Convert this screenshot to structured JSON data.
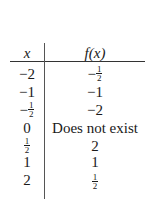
{
  "table": {
    "headers": {
      "x": "x",
      "f": "f(x)"
    },
    "rows": [
      {
        "x": {
          "sign": "−",
          "value": "2"
        },
        "f": {
          "sign": "−",
          "num": "1",
          "den": "2"
        }
      },
      {
        "x": {
          "sign": "−",
          "value": "1"
        },
        "f": {
          "sign": "−",
          "value": "1"
        }
      },
      {
        "x": {
          "sign": "−",
          "num": "1",
          "den": "2"
        },
        "f": {
          "sign": "−",
          "value": "2"
        }
      },
      {
        "x": {
          "sign": "",
          "value": "0"
        },
        "f": {
          "sign": "",
          "value": "Does not exist"
        }
      },
      {
        "x": {
          "sign": "",
          "num": "1",
          "den": "2"
        },
        "f": {
          "sign": "",
          "value": "2"
        }
      },
      {
        "x": {
          "sign": "",
          "value": "1"
        },
        "f": {
          "sign": "",
          "value": "1"
        }
      },
      {
        "x": {
          "sign": "",
          "value": "2"
        },
        "f": {
          "sign": "",
          "num": "1",
          "den": "2"
        }
      }
    ]
  }
}
